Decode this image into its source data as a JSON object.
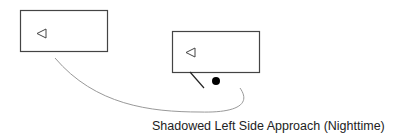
{
  "diagram": {
    "caption": "Shadowed Left Side Approach (Nighttime)",
    "elements": [
      {
        "type": "vehicle-box",
        "name": "vehicle-1",
        "icon": "left-triangle-icon"
      },
      {
        "type": "vehicle-box",
        "name": "vehicle-2",
        "icon": "left-triangle-icon"
      },
      {
        "type": "line",
        "name": "shadow-line"
      },
      {
        "type": "dot",
        "name": "black-dot"
      },
      {
        "type": "curve",
        "name": "approach-path"
      }
    ],
    "colors": {
      "stroke": "#444444",
      "curve": "#999999",
      "dot": "#000000"
    }
  }
}
